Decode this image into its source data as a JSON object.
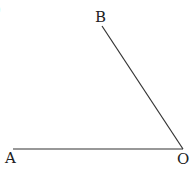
{
  "diagram": {
    "type": "angle",
    "partial_label": ")",
    "points": {
      "A": {
        "label": "A",
        "x": 13,
        "y": 149
      },
      "O": {
        "label": "O",
        "x": 183,
        "y": 149
      },
      "B": {
        "label": "B",
        "x": 102,
        "y": 26
      }
    },
    "segments": [
      {
        "from": "O",
        "to": "A"
      },
      {
        "from": "O",
        "to": "B"
      }
    ],
    "line_color": "#333333"
  }
}
